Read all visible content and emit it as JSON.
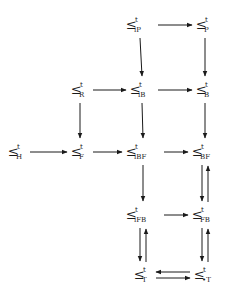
{
  "diagram": {
    "relation_symbol": "≤",
    "superscript": "t",
    "nodes": [
      {
        "id": "iP",
        "sub": "iP"
      },
      {
        "id": "P",
        "sub": "P"
      },
      {
        "id": "R",
        "sub": "R"
      },
      {
        "id": "iB",
        "sub": "iB"
      },
      {
        "id": "B",
        "sub": "B"
      },
      {
        "id": "H",
        "sub": "H"
      },
      {
        "id": "F",
        "sub": "F"
      },
      {
        "id": "iBF",
        "sub": "iBF"
      },
      {
        "id": "BF",
        "sub": "BF"
      },
      {
        "id": "iFB",
        "sub": "iFB"
      },
      {
        "id": "FB",
        "sub": "FB"
      },
      {
        "id": "T",
        "sub": "T"
      },
      {
        "id": "dT",
        "sub": "•T"
      }
    ],
    "edges": [
      {
        "from": "iP",
        "to": "P"
      },
      {
        "from": "iP",
        "to": "iB"
      },
      {
        "from": "P",
        "to": "B"
      },
      {
        "from": "R",
        "to": "iB"
      },
      {
        "from": "iB",
        "to": "B"
      },
      {
        "from": "R",
        "to": "F"
      },
      {
        "from": "iB",
        "to": "iBF"
      },
      {
        "from": "B",
        "to": "BF"
      },
      {
        "from": "H",
        "to": "F"
      },
      {
        "from": "F",
        "to": "iBF"
      },
      {
        "from": "iBF",
        "to": "BF"
      },
      {
        "from": "iBF",
        "to": "iFB"
      },
      {
        "from": "BF",
        "to": "FB"
      },
      {
        "from": "FB",
        "to": "BF"
      },
      {
        "from": "iFB",
        "to": "FB"
      },
      {
        "from": "iFB",
        "to": "T"
      },
      {
        "from": "T",
        "to": "iFB"
      },
      {
        "from": "FB",
        "to": "dT"
      },
      {
        "from": "dT",
        "to": "FB"
      },
      {
        "from": "dT",
        "to": "T"
      },
      {
        "from": "T",
        "to": "dT"
      }
    ]
  }
}
